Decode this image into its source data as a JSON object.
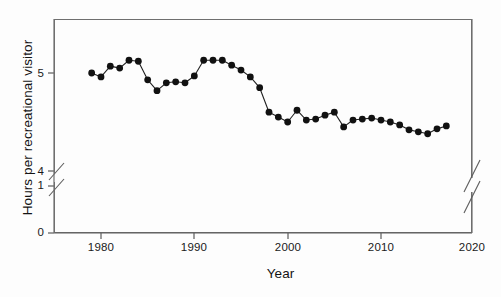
{
  "chart_data": {
    "type": "line",
    "title": "",
    "subtitle": "",
    "xlabel": "Year",
    "ylabel": "Hours per recreational visitor",
    "xlim": [
      1976,
      2020
    ],
    "ylim": [
      0,
      5.45
    ],
    "y_axis_break": {
      "present": true,
      "between": [
        1,
        4
      ],
      "labels_shown": [
        "0",
        "1",
        "4",
        "5"
      ]
    },
    "x_axis_break": {
      "present": true,
      "near": 2020,
      "note": "break marks on right frame edge"
    },
    "grid": false,
    "legend": null,
    "marker": "filled-circle",
    "line_color": "#222222",
    "marker_color": "#111111",
    "ytick_labels": [
      "0",
      "1",
      "4",
      "5"
    ],
    "ytick_values": [
      0,
      1,
      4,
      5
    ],
    "xtick_labels": [
      "1980",
      "1990",
      "2000",
      "2010",
      "2020"
    ],
    "xtick_values": [
      1980,
      1990,
      2000,
      2010,
      2020
    ],
    "x": [
      1979,
      1980,
      1981,
      1982,
      1983,
      1984,
      1985,
      1986,
      1987,
      1988,
      1989,
      1990,
      1991,
      1992,
      1993,
      1994,
      1995,
      1996,
      1997,
      1998,
      1999,
      2000,
      2001,
      2002,
      2003,
      2004,
      2005,
      2006,
      2007,
      2008,
      2009,
      2010,
      2011,
      2012,
      2013,
      2014,
      2015,
      2016,
      2017
    ],
    "values": [
      5.0,
      4.96,
      5.07,
      5.05,
      5.13,
      5.12,
      4.93,
      4.82,
      4.9,
      4.91,
      4.9,
      4.97,
      5.13,
      5.13,
      5.13,
      5.08,
      5.03,
      4.96,
      4.85,
      4.6,
      4.55,
      4.5,
      4.62,
      4.52,
      4.53,
      4.57,
      4.6,
      4.45,
      4.52,
      4.53,
      4.54,
      4.52,
      4.5,
      4.47,
      4.42,
      4.4,
      4.38,
      4.43,
      4.46
    ],
    "series": [
      {
        "name": "Hours per recreational visitor",
        "values": [
          5.0,
          4.96,
          5.07,
          5.05,
          5.13,
          5.12,
          4.93,
          4.82,
          4.9,
          4.91,
          4.9,
          4.97,
          5.13,
          5.13,
          5.13,
          5.08,
          5.03,
          4.96,
          4.85,
          4.6,
          4.55,
          4.5,
          4.62,
          4.52,
          4.53,
          4.57,
          4.6,
          4.45,
          4.52,
          4.53,
          4.54,
          4.52,
          4.5,
          4.47,
          4.42,
          4.4,
          4.38,
          4.43,
          4.46
        ]
      }
    ],
    "annotations": []
  },
  "axis": {
    "y_title": "Hours per recreational visitor",
    "x_title": "Year",
    "yticks": [
      {
        "label": "5",
        "top": 67
      },
      {
        "label": "4",
        "top": 165
      },
      {
        "label": "1",
        "top": 179
      },
      {
        "label": "0",
        "top": 226
      }
    ],
    "xticks": [
      {
        "label": "1980",
        "left": 101
      },
      {
        "label": "1990",
        "left": 194
      },
      {
        "label": "2000",
        "left": 288
      },
      {
        "label": "2010",
        "left": 381
      },
      {
        "label": "2020",
        "left": 472
      }
    ]
  },
  "colors": {
    "frame": "#6f6f6f",
    "line": "#222222",
    "marker": "#111111",
    "background": "#fdfdfd",
    "text": "#141414"
  }
}
